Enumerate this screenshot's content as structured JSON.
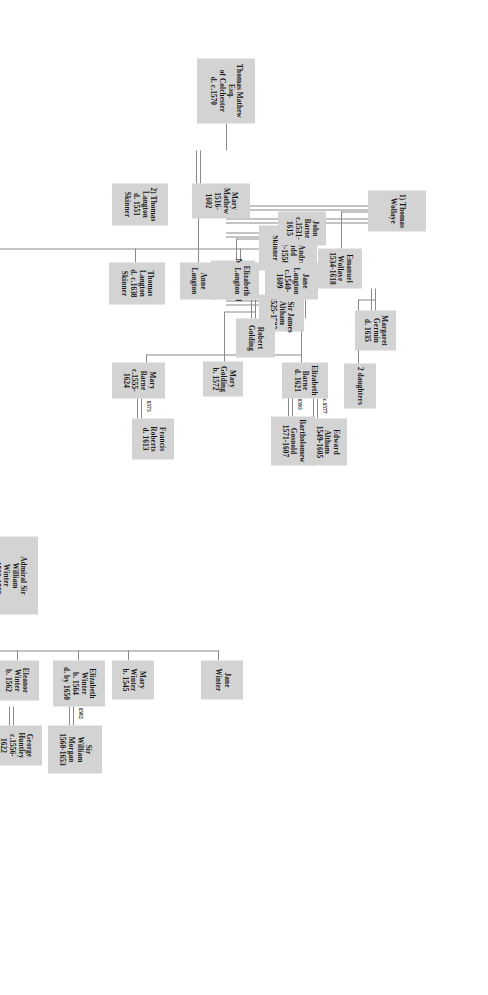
{
  "chart_data": {
    "type": "diagram",
    "title": "",
    "diagram_kind": "genealogy-family-tree",
    "orientation": "rotated-90-clockwise",
    "box_fill": "#d3d3d3",
    "line_color": "#8a8a8a",
    "nodes": [
      {
        "id": "thomas_mathew",
        "lines": [
          "Thomas Mathew",
          "Esq.",
          "of Colchester",
          "d. c.1570"
        ]
      },
      {
        "id": "mary_mathew",
        "lines": [
          "Mary",
          "Mathew",
          "1516-",
          "1602"
        ]
      },
      {
        "id": "h1_wollaye",
        "lines": [
          "1) Thomas",
          "Wollaye"
        ]
      },
      {
        "id": "h2_langton",
        "lines": [
          "2) Thomas",
          "Langton",
          "d. 1551",
          "Skinner"
        ]
      },
      {
        "id": "h3_judd",
        "lines": [
          "3) Sir Andrew",
          "Judd",
          "1492-1558",
          "Skinner"
        ]
      },
      {
        "id": "h4_altham",
        "lines": [
          "4) Sir James",
          "Altham",
          "1525-1583"
        ]
      },
      {
        "id": "emanuel",
        "lines": [
          "Emanuel",
          "Wollaye",
          "1534-1618"
        ]
      },
      {
        "id": "margaret_germin",
        "lines": [
          "Margaret",
          "Germin",
          "d. 1635"
        ]
      },
      {
        "id": "two_daughters",
        "lines": [
          "2 daughters"
        ]
      },
      {
        "id": "martha_judd",
        "lines": [
          "Martha Judd",
          "d. 1578"
        ]
      },
      {
        "id": "robert_golding",
        "lines": [
          "Robert",
          "Golding"
        ]
      },
      {
        "id": "mary_golding",
        "lines": [
          "Mary",
          "Golding",
          "b. 1572"
        ]
      },
      {
        "id": "gosnold",
        "lines": [
          "Bartholomew",
          "Gosnold",
          "1571-1607"
        ]
      },
      {
        "id": "jane_langton",
        "lines": [
          "Jane",
          "Langton",
          "c.1540-",
          "1609"
        ]
      },
      {
        "id": "john_barne",
        "lines": [
          "John",
          "Barne",
          "c.1531-",
          "1615"
        ]
      },
      {
        "id": "elizabeth_barne",
        "lines": [
          "Elizabeth",
          "Barne",
          "d. 1621"
        ]
      },
      {
        "id": "edward_altham",
        "lines": [
          "Edward",
          "Altham",
          "1549-1605"
        ]
      },
      {
        "id": "mary_barne",
        "lines": [
          "Mary",
          "Barne",
          "c.1555-",
          "1624"
        ]
      },
      {
        "id": "francis_roberts",
        "lines": [
          "Francis",
          "Roberts",
          "d. 1613"
        ]
      },
      {
        "id": "elizabeth_langton",
        "lines": [
          "Elizabeth",
          "Langton"
        ]
      },
      {
        "id": "anne_langton",
        "lines": [
          "Anne",
          "Langton"
        ]
      },
      {
        "id": "thomas_langton_jr",
        "lines": [
          "Thomas",
          "Langton",
          "d. c.1638",
          "Skinner"
        ]
      },
      {
        "id": "admiral_winter",
        "lines": [
          "Admiral Sir",
          "William",
          "Winter",
          "c.1532-1589",
          "Surveyor of",
          "the Navy"
        ]
      },
      {
        "id": "mary_langton",
        "lines": [
          "Mary",
          "Langton",
          "1535-",
          "1575"
        ]
      },
      {
        "id": "elizabeth_winter",
        "lines": [
          "Elizabeth",
          "Winter",
          "b. 1564",
          "d. by 1650"
        ]
      },
      {
        "id": "william_morgan",
        "lines": [
          "Sir",
          "William",
          "Morgan",
          "1560-1653"
        ]
      },
      {
        "id": "eleanor_winter",
        "lines": [
          "Eleanor",
          "Winter",
          "b. 1562"
        ]
      },
      {
        "id": "george_huntley",
        "lines": [
          "George",
          "Huntley",
          "c.1556-",
          "1622"
        ]
      },
      {
        "id": "capt_winter",
        "lines": [
          "Capt.",
          "William",
          "Winter",
          "b. 1558"
        ]
      },
      {
        "id": "edward_winter",
        "lines": [
          "Sir Edward",
          "Winter",
          "1554-1619"
        ]
      },
      {
        "id": "anna_somerset",
        "lines": [
          "Anna",
          "Somerset"
        ]
      },
      {
        "id": "mary_winter",
        "lines": [
          "Mary",
          "Winter",
          "b. 1545"
        ]
      },
      {
        "id": "jane_winter",
        "lines": [
          "Jane",
          "Winter"
        ]
      }
    ],
    "marriage_years": [
      {
        "id": "y_gosnold_golding",
        "label": "1595",
        "couple": [
          "mary_golding",
          "gosnold"
        ]
      },
      {
        "id": "y_altham_barne",
        "label": "c.1577",
        "couple": [
          "elizabeth_barne",
          "edward_altham"
        ]
      },
      {
        "id": "y_roberts_barne",
        "label": "1575",
        "couple": [
          "mary_barne",
          "francis_roberts"
        ]
      },
      {
        "id": "y_morgan_winter",
        "label": "1582",
        "couple": [
          "elizabeth_winter",
          "william_morgan"
        ]
      },
      {
        "id": "y_winter_langton",
        "label": "1553",
        "couple": [
          "mary_langton",
          "admiral_winter"
        ]
      }
    ],
    "relationships": [
      {
        "type": "marriage",
        "from": "thomas_mathew",
        "to": "mary_mathew"
      },
      {
        "type": "marriage",
        "from": "mary_mathew",
        "to": "h1_wollaye"
      },
      {
        "type": "marriage",
        "from": "mary_mathew",
        "to": "h2_langton"
      },
      {
        "type": "marriage",
        "from": "mary_mathew",
        "to": "h3_judd"
      },
      {
        "type": "marriage",
        "from": "mary_mathew",
        "to": "h4_altham"
      },
      {
        "type": "child",
        "from": "h1_wollaye",
        "to": "emanuel"
      },
      {
        "type": "marriage",
        "from": "emanuel",
        "to": "margaret_germin"
      },
      {
        "type": "child",
        "from": "emanuel",
        "to": "two_daughters"
      },
      {
        "type": "child",
        "from": "h3_judd",
        "to": "martha_judd"
      },
      {
        "type": "marriage",
        "from": "martha_judd",
        "to": "robert_golding"
      },
      {
        "type": "child",
        "from": "martha_judd",
        "to": "mary_golding"
      },
      {
        "type": "marriage",
        "from": "mary_golding",
        "to": "gosnold"
      },
      {
        "type": "child",
        "from": "h2_langton",
        "to": "jane_langton"
      },
      {
        "type": "child",
        "from": "h2_langton",
        "to": "elizabeth_langton"
      },
      {
        "type": "child",
        "from": "h2_langton",
        "to": "anne_langton"
      },
      {
        "type": "child",
        "from": "h2_langton",
        "to": "thomas_langton_jr"
      },
      {
        "type": "child",
        "from": "h2_langton",
        "to": "mary_langton"
      },
      {
        "type": "marriage",
        "from": "jane_langton",
        "to": "john_barne"
      },
      {
        "type": "child",
        "from": "jane_langton",
        "to": "elizabeth_barne"
      },
      {
        "type": "child",
        "from": "jane_langton",
        "to": "mary_barne"
      },
      {
        "type": "marriage",
        "from": "elizabeth_barne",
        "to": "edward_altham"
      },
      {
        "type": "marriage",
        "from": "mary_barne",
        "to": "francis_roberts"
      },
      {
        "type": "marriage",
        "from": "mary_langton",
        "to": "admiral_winter"
      },
      {
        "type": "child",
        "from": "mary_langton",
        "to": "elizabeth_winter"
      },
      {
        "type": "child",
        "from": "mary_langton",
        "to": "eleanor_winter"
      },
      {
        "type": "child",
        "from": "mary_langton",
        "to": "capt_winter"
      },
      {
        "type": "child",
        "from": "mary_langton",
        "to": "edward_winter"
      },
      {
        "type": "child",
        "from": "mary_langton",
        "to": "mary_winter"
      },
      {
        "type": "child",
        "from": "mary_langton",
        "to": "jane_winter"
      },
      {
        "type": "marriage",
        "from": "elizabeth_winter",
        "to": "william_morgan"
      },
      {
        "type": "marriage",
        "from": "eleanor_winter",
        "to": "george_huntley"
      },
      {
        "type": "marriage",
        "from": "edward_winter",
        "to": "anna_somerset"
      }
    ]
  }
}
